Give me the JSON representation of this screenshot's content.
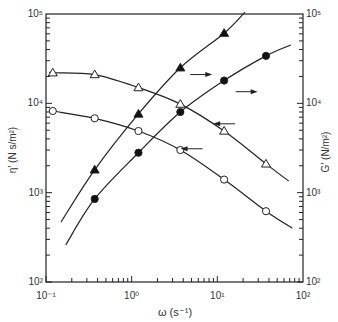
{
  "chart_data": {
    "type": "line",
    "title": "",
    "xlabel": "ω (s⁻¹)",
    "ylabel_left": "η′ (N s/m²)",
    "ylabel_right": "G′ (N/m²)",
    "xscale": "log",
    "yscale": "log",
    "xlim": [
      0.1,
      100
    ],
    "ylim_left": [
      100,
      100000
    ],
    "ylim_right": [
      100,
      100000
    ],
    "x_tick_labels": [
      "10⁻¹",
      "10⁰",
      "10¹",
      "10²"
    ],
    "y_tick_labels_left": [
      "10²",
      "10³",
      "10⁴",
      "10⁵"
    ],
    "y_tick_labels_right": [
      "10²",
      "10³",
      "10⁴",
      "10⁵"
    ],
    "grid": false,
    "legend": "none (arrows indicate axis: left-pointing → η′ left axis, right-pointing → G′ right axis)",
    "series": [
      {
        "name": "η′ (open triangles)",
        "axis": "left",
        "marker": "open-triangle",
        "x": [
          0.12,
          0.37,
          1.2,
          3.7,
          12,
          37
        ],
        "y": [
          22000,
          21000,
          15000,
          9800,
          4900,
          2100
        ],
        "curve_start": [
          0.12,
          22500
        ],
        "curve_end": [
          68,
          1350
        ]
      },
      {
        "name": "η′ (open circles)",
        "axis": "left",
        "marker": "open-circle",
        "x": [
          0.12,
          0.37,
          1.2,
          3.7,
          12,
          37
        ],
        "y": [
          8200,
          6800,
          4900,
          3000,
          1400,
          620
        ],
        "curve_start": [
          0.12,
          8300
        ],
        "curve_end": [
          75,
          400
        ]
      },
      {
        "name": "G′ (filled triangles)",
        "axis": "right",
        "marker": "filled-triangle",
        "x": [
          0.37,
          1.2,
          3.7,
          12
        ],
        "y": [
          1800,
          7600,
          25000,
          61000
        ],
        "curve_start": [
          0.15,
          470
        ],
        "curve_end": [
          21,
          105000
        ]
      },
      {
        "name": "G′ (filled circles)",
        "axis": "right",
        "marker": "filled-circle",
        "x": [
          0.37,
          1.2,
          3.7,
          12,
          37
        ],
        "y": [
          850,
          2800,
          8000,
          18000,
          34000
        ],
        "curve_start": [
          0.17,
          260
        ],
        "curve_end": [
          72,
          45000
        ]
      }
    ],
    "annotations": [
      {
        "type": "arrow-right",
        "near_series": "G′ (filled triangles)",
        "x": 6.5,
        "y": 21000
      },
      {
        "type": "arrow-right",
        "near_series": "G′ (filled circles)",
        "x": 22,
        "y": 13500
      },
      {
        "type": "arrow-left",
        "near_series": "η′ (open triangles)",
        "x": 12,
        "y": 5900
      },
      {
        "type": "arrow-left",
        "near_series": "η′ (open circles)",
        "x": 5,
        "y": 3100
      }
    ]
  }
}
